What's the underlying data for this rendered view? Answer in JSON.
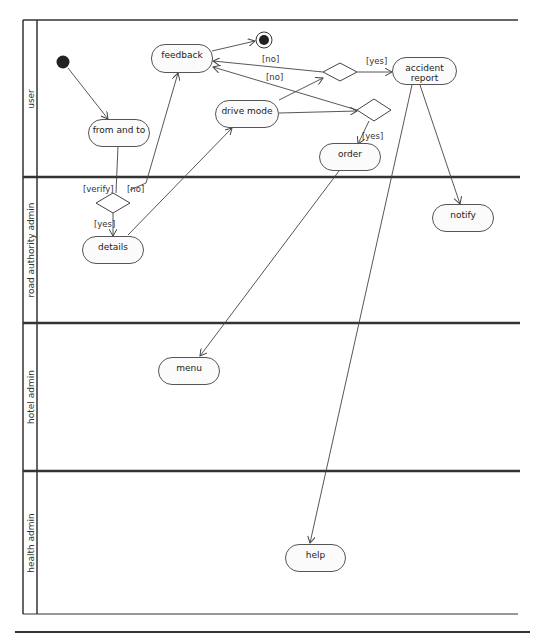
{
  "diagram": {
    "type": "UML activity diagram with swimlanes",
    "lanes": [
      {
        "label": "user"
      },
      {
        "label": "road authority admin"
      },
      {
        "label": "hotel admin"
      },
      {
        "label": "health admin"
      }
    ],
    "activities": {
      "feedback": "feedback",
      "from_and_to": "from and to",
      "drive_mode": "drive mode",
      "accident_report": "accident report",
      "order": "order",
      "details": "details",
      "notify": "notify",
      "menu": "menu",
      "help": "help"
    },
    "guards": {
      "no_top": "[no]",
      "no_mid": "[no]",
      "yes_accident": "[yes]",
      "yes_order": "[yes]",
      "verify": "[verify]",
      "no_verify": "[no]",
      "yes_details": "[yes]"
    },
    "colors": {
      "line": "#444444",
      "lane_border": "#333333",
      "node_fill": "#fbfbfb",
      "initial": "#222222"
    }
  }
}
